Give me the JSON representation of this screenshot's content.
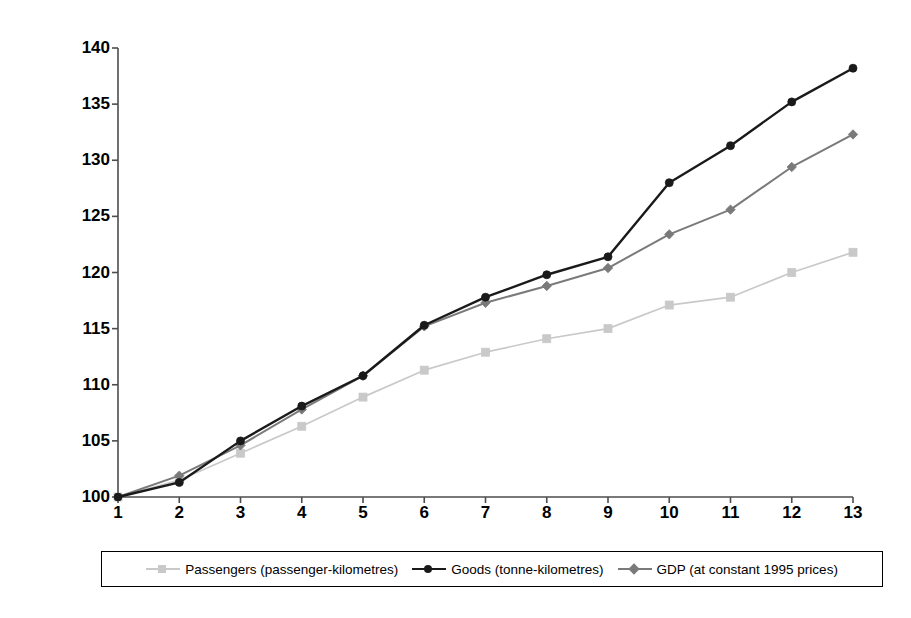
{
  "chart_data": {
    "type": "line",
    "title": "",
    "xlabel": "",
    "ylabel": "Index (based on 1995 = 100)",
    "x": [
      1,
      2,
      3,
      4,
      5,
      6,
      7,
      8,
      9,
      10,
      11,
      12,
      13
    ],
    "xtick_labels": [
      "1",
      "2",
      "3",
      "4",
      "5",
      "6",
      "7",
      "8",
      "9",
      "10",
      "11",
      "12",
      "13"
    ],
    "ytick_labels": [
      "100",
      "105",
      "110",
      "115",
      "120",
      "125",
      "130",
      "135",
      "140"
    ],
    "yticks": [
      100,
      105,
      110,
      115,
      120,
      125,
      130,
      135,
      140
    ],
    "ylim": [
      100,
      140
    ],
    "xlim": [
      1,
      13
    ],
    "grid": false,
    "legend_position": "bottom",
    "series": [
      {
        "name": "Passengers (passenger-kilometres)",
        "color": "#c9c9c9",
        "marker": "square",
        "values": [
          100.0,
          101.5,
          103.9,
          106.3,
          108.9,
          111.3,
          112.9,
          114.1,
          115.0,
          117.1,
          117.8,
          120.0,
          121.8
        ]
      },
      {
        "name": "Goods (tonne-kilometres)",
        "color": "#1a1a1a",
        "marker": "circle",
        "values": [
          100.0,
          101.3,
          105.0,
          108.1,
          110.8,
          115.3,
          117.8,
          119.8,
          121.4,
          128.0,
          131.3,
          135.2,
          138.2
        ]
      },
      {
        "name": "GDP (at constant 1995 prices)",
        "color": "#7a7a7a",
        "marker": "diamond",
        "values": [
          100.0,
          101.9,
          104.6,
          107.8,
          110.8,
          115.2,
          117.3,
          118.8,
          120.4,
          123.4,
          125.6,
          129.4,
          132.3
        ]
      }
    ]
  },
  "axis": {
    "y_title": "Index (based on 1995 = 100)"
  }
}
